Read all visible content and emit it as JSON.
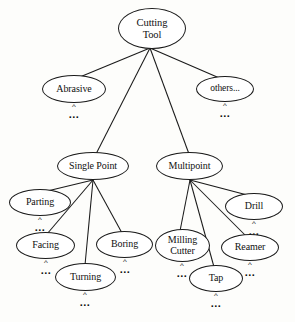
{
  "diagram": {
    "type": "hierarchy-tree",
    "stroke_color": "#1a1a1a",
    "background_color": "#fdfdfb",
    "text_color": "#111111",
    "ellipsis_symbol": "...",
    "caret_symbol": "^"
  },
  "nodes": [
    {
      "id": "cutting-tool",
      "label": "Cutting\nTool",
      "level": 0,
      "x": 118,
      "y": 8,
      "w": 68,
      "h": 41,
      "font_size": 10.5,
      "has_ellipsis": false
    },
    {
      "id": "abrasive",
      "label": "Abrasive",
      "level": 1,
      "x": 42,
      "y": 75,
      "w": 64,
      "h": 28,
      "font_size": 10,
      "has_ellipsis": true,
      "dots_x": 63,
      "dots_y": 104
    },
    {
      "id": "others",
      "label": "others...",
      "level": 1,
      "x": 196,
      "y": 76,
      "w": 58,
      "h": 26,
      "font_size": 9.5,
      "has_ellipsis": true,
      "dots_x": 214,
      "dots_y": 103
    },
    {
      "id": "single-point",
      "label": "Single Point",
      "level": 1,
      "x": 57,
      "y": 152,
      "w": 72,
      "h": 28,
      "font_size": 10,
      "has_ellipsis": false
    },
    {
      "id": "multipoint",
      "label": "Multipoint",
      "level": 1,
      "x": 156,
      "y": 152,
      "w": 67,
      "h": 28,
      "font_size": 10,
      "has_ellipsis": false
    },
    {
      "id": "parting",
      "label": "Parting",
      "level": 2,
      "x": 9,
      "y": 189,
      "w": 62,
      "h": 27,
      "font_size": 10,
      "has_ellipsis": true,
      "dots_x": 29,
      "dots_y": 217
    },
    {
      "id": "facing",
      "label": "Facing",
      "level": 2,
      "x": 16,
      "y": 232,
      "w": 59,
      "h": 27,
      "font_size": 10,
      "has_ellipsis": true,
      "dots_x": 35,
      "dots_y": 260
    },
    {
      "id": "turning",
      "label": "Turning",
      "level": 2,
      "x": 55,
      "y": 263,
      "w": 61,
      "h": 28,
      "font_size": 10,
      "has_ellipsis": true,
      "dots_x": 74,
      "dots_y": 292
    },
    {
      "id": "boring",
      "label": "Boring",
      "level": 2,
      "x": 96,
      "y": 231,
      "w": 57,
      "h": 27,
      "font_size": 10,
      "has_ellipsis": true,
      "dots_x": 114,
      "dots_y": 259
    },
    {
      "id": "milling-cutter",
      "label": "Milling\nCutter",
      "level": 2,
      "x": 155,
      "y": 229,
      "w": 55,
      "h": 33,
      "font_size": 10,
      "has_ellipsis": true,
      "dots_x": 171,
      "dots_y": 263
    },
    {
      "id": "tap",
      "label": "Tap",
      "level": 2,
      "x": 189,
      "y": 265,
      "w": 54,
      "h": 27,
      "font_size": 10,
      "has_ellipsis": true,
      "dots_x": 205,
      "dots_y": 293
    },
    {
      "id": "reamer",
      "label": "Reamer",
      "level": 2,
      "x": 221,
      "y": 234,
      "w": 58,
      "h": 27,
      "font_size": 10,
      "has_ellipsis": true,
      "dots_x": 239,
      "dots_y": 262
    },
    {
      "id": "drill",
      "label": "Drill",
      "level": 2,
      "x": 225,
      "y": 193,
      "w": 58,
      "h": 27,
      "font_size": 10,
      "has_ellipsis": true,
      "dots_x": 243,
      "dots_y": 221
    }
  ],
  "edges": [
    {
      "from": "cutting-tool",
      "to": "abrasive",
      "x1": 150,
      "y1": 48,
      "x2": 75,
      "y2": 79
    },
    {
      "from": "cutting-tool",
      "to": "single-point",
      "x1": 150,
      "y1": 48,
      "x2": 96,
      "y2": 154
    },
    {
      "from": "cutting-tool",
      "to": "multipoint",
      "x1": 150,
      "y1": 48,
      "x2": 189,
      "y2": 154
    },
    {
      "from": "cutting-tool",
      "to": "others",
      "x1": 150,
      "y1": 48,
      "x2": 224,
      "y2": 80
    },
    {
      "from": "single-point",
      "to": "parting",
      "x1": 93,
      "y1": 180,
      "x2": 39,
      "y2": 193
    },
    {
      "from": "single-point",
      "to": "facing",
      "x1": 93,
      "y1": 180,
      "x2": 47,
      "y2": 234
    },
    {
      "from": "single-point",
      "to": "turning",
      "x1": 93,
      "y1": 180,
      "x2": 85,
      "y2": 265
    },
    {
      "from": "single-point",
      "to": "boring",
      "x1": 93,
      "y1": 180,
      "x2": 122,
      "y2": 233
    },
    {
      "from": "multipoint",
      "to": "milling-cutter",
      "x1": 190,
      "y1": 180,
      "x2": 180,
      "y2": 231
    },
    {
      "from": "multipoint",
      "to": "tap",
      "x1": 190,
      "y1": 180,
      "x2": 214,
      "y2": 267
    },
    {
      "from": "multipoint",
      "to": "reamer",
      "x1": 190,
      "y1": 180,
      "x2": 246,
      "y2": 236
    },
    {
      "from": "multipoint",
      "to": "drill",
      "x1": 190,
      "y1": 180,
      "x2": 251,
      "y2": 196
    }
  ]
}
